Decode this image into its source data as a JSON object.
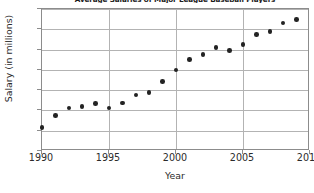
{
  "chart_data": {
    "type": "scatter",
    "title": "Average Salaries of Major League Baseball Players",
    "xlabel": "Year",
    "ylabel": "Salary (in millions)",
    "xlim": [
      1990,
      2010
    ],
    "ylim": [
      0.0,
      3.5
    ],
    "grid": true,
    "legend": "none",
    "x_tick_labels": [
      "1990",
      "1995",
      "2000",
      "2005",
      "2010"
    ],
    "x_tick_values": [
      1990,
      1995,
      2000,
      2005,
      2010
    ],
    "y_tick_labels": [
      "0.00",
      "0.50",
      "1.00",
      "1.50",
      "2.00",
      "2.50",
      "3.00",
      "3.50"
    ],
    "y_tick_values": [
      0.0,
      0.5,
      1.0,
      1.5,
      2.0,
      2.5,
      3.0,
      3.5
    ],
    "x": [
      1990,
      1991,
      1992,
      1993,
      1994,
      1995,
      1996,
      1997,
      1998,
      1999,
      2000,
      2001,
      2002,
      2003,
      2004,
      2005,
      2006,
      2007,
      2008,
      2009
    ],
    "values": [
      0.58,
      0.88,
      1.06,
      1.1,
      1.17,
      1.06,
      1.18,
      1.38,
      1.44,
      1.72,
      2.0,
      2.26,
      2.38,
      2.55,
      2.48,
      2.63,
      2.87,
      2.94,
      3.15,
      3.24
    ],
    "series": [
      {
        "name": "Average Salary",
        "marker": "filled-circle",
        "color": "#232323",
        "values": [
          0.58,
          0.88,
          1.06,
          1.1,
          1.17,
          1.06,
          1.18,
          1.38,
          1.44,
          1.72,
          2.0,
          2.26,
          2.38,
          2.55,
          2.48,
          2.63,
          2.87,
          2.94,
          3.15,
          3.24
        ]
      }
    ]
  },
  "colors": {
    "marker": "#232323",
    "grid": "#b3b3b3",
    "frame": "#8c8c8c",
    "text": "#2b2b2b",
    "background": "#ffffff"
  }
}
